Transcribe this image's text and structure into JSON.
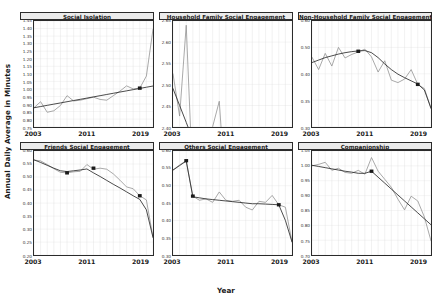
{
  "figure": {
    "ylabel": "Annual Daily Average in Minutes",
    "xlabel": "Year"
  },
  "axis": {
    "xticks": [
      "2003",
      "2011",
      "2019"
    ],
    "xlim": [
      2003,
      2021
    ]
  },
  "style": {
    "series_color": "#8c8c8c",
    "trend_color": "#2b2b2b",
    "marker_color": "#1a1a1a",
    "grid_color": "#d9d9d9",
    "panel_header_bg": "#ebebeb",
    "border_color": "#2b2b2b"
  },
  "chart_data": [
    {
      "type": "line",
      "title": "Social Isolation",
      "xlabel": "Year",
      "ylabel": "Annual Daily Average in Minutes",
      "ylim": [
        0.75,
        1.45
      ],
      "yticks": [
        "1.45",
        "1.40",
        "1.35",
        "1.30",
        "1.25",
        "1.20",
        "1.15",
        "1.10",
        "1.05",
        "1.00",
        "0.95",
        "0.90",
        "0.85",
        "0.80",
        "0.75"
      ],
      "x": [
        2003,
        2004,
        2005,
        2006,
        2007,
        2008,
        2009,
        2010,
        2011,
        2012,
        2013,
        2014,
        2015,
        2016,
        2017,
        2018,
        2019,
        2020,
        2021
      ],
      "series": [
        {
          "name": "observed",
          "values": [
            0.875,
            0.915,
            0.845,
            0.855,
            0.89,
            0.955,
            0.92,
            0.925,
            0.935,
            0.945,
            0.93,
            0.925,
            0.955,
            0.985,
            1.02,
            1.0,
            1.005,
            1.085,
            1.395
          ]
        },
        {
          "name": "trend",
          "values": [
            0.875,
            0.883,
            0.891,
            0.899,
            0.907,
            0.915,
            0.923,
            0.931,
            0.939,
            0.947,
            0.955,
            0.963,
            0.971,
            0.979,
            0.987,
            0.995,
            1.003,
            1.011,
            1.019
          ]
        }
      ],
      "markers": [
        {
          "x": 2019,
          "y": 1.005
        }
      ],
      "grid": true
    },
    {
      "type": "line",
      "title": "Household Family Social Engagement",
      "xlabel": "Year",
      "ylabel": "Annual Daily Average in Minutes",
      "ylim": [
        2.6,
        2.65
      ],
      "yticks": [
        "2.65",
        "2.60",
        "2.55",
        "2.50",
        "2.45",
        "2.40"
      ],
      "x": [
        2003,
        2004,
        2005,
        2006,
        2007,
        2008,
        2009,
        2010,
        2011,
        2012,
        2013,
        2014,
        2015,
        2016,
        2017,
        2018,
        2019,
        2020,
        2021
      ],
      "series": [
        {
          "name": "observed",
          "values": [
            2.625,
            2.605,
            2.648,
            2.573,
            2.598,
            2.57,
            2.6,
            2.612,
            2.566,
            2.524,
            2.575,
            2.59,
            2.545,
            2.52,
            2.545,
            2.489,
            2.575,
            2.468,
            2.548
          ]
        },
        {
          "name": "trend",
          "values": [
            2.618,
            2.61,
            2.602,
            2.594,
            2.586,
            2.578,
            2.57,
            2.562,
            2.554,
            2.546,
            2.538,
            2.53,
            2.522,
            2.514,
            2.506,
            2.498,
            2.49,
            2.482,
            2.474
          ]
        }
      ],
      "markers": [
        {
          "x": 2006,
          "y": 2.596
        }
      ],
      "grid": true
    },
    {
      "type": "line",
      "title": "Non-Household Family Social Engagement",
      "xlabel": "Year",
      "ylabel": "Annual Daily Average in Minutes",
      "ylim": [
        0.3,
        0.6
      ],
      "yticks": [
        "0.60",
        "0.50",
        "0.40",
        "0.35",
        "0.30"
      ],
      "x": [
        2003,
        2004,
        2005,
        2006,
        2007,
        2008,
        2009,
        2010,
        2011,
        2012,
        2013,
        2014,
        2015,
        2016,
        2017,
        2018,
        2019,
        2020,
        2021
      ],
      "series": [
        {
          "name": "observed",
          "values": [
            0.497,
            0.462,
            0.508,
            0.472,
            0.525,
            0.495,
            0.505,
            0.512,
            0.52,
            0.498,
            0.455,
            0.487,
            0.432,
            0.425,
            0.435,
            0.462,
            0.42,
            0.408,
            0.352
          ]
        },
        {
          "name": "trend",
          "values": [
            0.482,
            0.489,
            0.496,
            0.501,
            0.506,
            0.51,
            0.513,
            0.515,
            0.516,
            0.51,
            0.496,
            0.478,
            0.462,
            0.449,
            0.439,
            0.43,
            0.421,
            0.404,
            0.352
          ]
        }
      ],
      "markers": [
        {
          "x": 2010,
          "y": 0.514
        },
        {
          "x": 2019,
          "y": 0.42
        }
      ],
      "grid": true
    },
    {
      "type": "line",
      "title": "Friends Social Engagement",
      "xlabel": "Year",
      "ylabel": "Annual Daily Average in Minutes",
      "ylim": [
        0.2,
        0.6
      ],
      "yticks": [
        "0.60",
        "0.55",
        "0.50",
        "0.45",
        "0.40",
        "0.35",
        "0.30",
        "0.25",
        "0.20"
      ],
      "x": [
        2003,
        2004,
        2005,
        2006,
        2007,
        2008,
        2009,
        2010,
        2011,
        2012,
        2013,
        2014,
        2015,
        2016,
        2017,
        2018,
        2019,
        2020,
        2021
      ],
      "series": [
        {
          "name": "observed",
          "values": [
            0.565,
            0.562,
            0.548,
            0.532,
            0.518,
            0.516,
            0.52,
            0.522,
            0.548,
            0.53,
            0.534,
            0.53,
            0.512,
            0.488,
            0.462,
            0.455,
            0.428,
            0.412,
            0.268
          ]
        },
        {
          "name": "trend",
          "values": [
            0.566,
            0.556,
            0.545,
            0.534,
            0.524,
            0.521,
            0.524,
            0.527,
            0.531,
            0.516,
            0.502,
            0.487,
            0.472,
            0.458,
            0.443,
            0.428,
            0.414,
            0.374,
            0.268
          ]
        }
      ],
      "markers": [
        {
          "x": 2008,
          "y": 0.516
        },
        {
          "x": 2012,
          "y": 0.534
        },
        {
          "x": 2019,
          "y": 0.428
        }
      ],
      "grid": true
    },
    {
      "type": "line",
      "title": "Others Social Engagement",
      "xlabel": "Year",
      "ylabel": "Annual Daily Average in Minutes",
      "ylim": [
        0.3,
        0.6
      ],
      "yticks": [
        "0.60",
        "0.55",
        "0.50",
        "0.45",
        "0.40",
        "0.35",
        "0.30"
      ],
      "x": [
        2003,
        2004,
        2005,
        2006,
        2007,
        2008,
        2009,
        2010,
        2011,
        2012,
        2013,
        2014,
        2015,
        2016,
        2017,
        2018,
        2019,
        2020,
        2021
      ],
      "series": [
        {
          "name": "observed",
          "values": [
            0.545,
            0.56,
            0.572,
            0.47,
            0.458,
            0.462,
            0.452,
            0.482,
            0.458,
            0.455,
            0.458,
            0.438,
            0.43,
            0.455,
            0.452,
            0.472,
            0.445,
            0.438,
            0.338
          ]
        },
        {
          "name": "trend",
          "values": [
            0.545,
            0.558,
            0.571,
            0.468,
            0.465,
            0.462,
            0.46,
            0.458,
            0.456,
            0.454,
            0.452,
            0.45,
            0.448,
            0.448,
            0.447,
            0.446,
            0.445,
            0.4,
            0.338
          ]
        }
      ],
      "markers": [
        {
          "x": 2005,
          "y": 0.572
        },
        {
          "x": 2006,
          "y": 0.47
        },
        {
          "x": 2019,
          "y": 0.445
        }
      ],
      "grid": true
    },
    {
      "type": "line",
      "title": "Companionship",
      "xlabel": "Year",
      "ylabel": "Annual Daily Average in Minutes",
      "ylim": [
        0.7,
        1.05
      ],
      "yticks": [
        "1.05",
        "1.00",
        "0.95",
        "0.90",
        "0.85",
        "0.80",
        "0.75",
        "0.70"
      ],
      "x": [
        2003,
        2004,
        2005,
        2006,
        2007,
        2008,
        2009,
        2010,
        2011,
        2012,
        2013,
        2014,
        2015,
        2016,
        2017,
        2018,
        2019,
        2020,
        2021
      ],
      "series": [
        {
          "name": "observed",
          "values": [
            1.0,
            1.005,
            1.012,
            0.985,
            0.992,
            0.978,
            0.975,
            0.985,
            0.972,
            1.028,
            0.982,
            0.955,
            0.928,
            0.888,
            0.852,
            0.898,
            0.882,
            0.828,
            0.748
          ]
        },
        {
          "name": "trend",
          "values": [
            1.002,
            0.998,
            0.994,
            0.99,
            0.986,
            0.982,
            0.979,
            0.975,
            0.975,
            0.982,
            0.962,
            0.942,
            0.922,
            0.902,
            0.882,
            0.862,
            0.842,
            0.822,
            0.802
          ]
        }
      ],
      "markers": [
        {
          "x": 2012,
          "y": 0.982
        }
      ],
      "grid": true
    }
  ]
}
